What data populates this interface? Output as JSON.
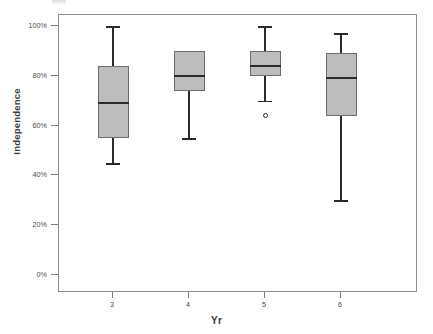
{
  "chart_data": {
    "type": "box",
    "title": "",
    "xlabel": "Yr",
    "ylabel": "Independence",
    "categories": [
      "3",
      "4",
      "5",
      "6"
    ],
    "xtick_labels": [
      "3",
      "4",
      "5",
      "6"
    ],
    "ytick_labels": [
      "100%",
      "80%",
      "60%",
      "40%",
      "20%",
      "0%"
    ],
    "ytick_values": [
      100,
      80,
      60,
      40,
      20,
      0
    ],
    "ylim": [
      0,
      100
    ],
    "y_unit": "%",
    "grid": false,
    "legend": "none",
    "box_fill_color": "#bdbdbd",
    "box_edge_color": "#6d6d6d",
    "median_color": "#2b2b2b",
    "frame_color": "#8d8d8d",
    "boxes": [
      {
        "category": "3",
        "whisker_low": 45,
        "q1": 55,
        "median": 69,
        "q3": 84,
        "whisker_high": 100,
        "outliers": []
      },
      {
        "category": "4",
        "whisker_low": 55,
        "q1": 74,
        "median": 80,
        "q3": 90,
        "whisker_high": 90,
        "outliers": []
      },
      {
        "category": "5",
        "whisker_low": 70,
        "q1": 80,
        "median": 84,
        "q3": 90,
        "whisker_high": 100,
        "outliers": [
          64
        ]
      },
      {
        "category": "6",
        "whisker_low": 30,
        "q1": 64,
        "median": 79,
        "q3": 89,
        "whisker_high": 97,
        "outliers": []
      }
    ]
  }
}
